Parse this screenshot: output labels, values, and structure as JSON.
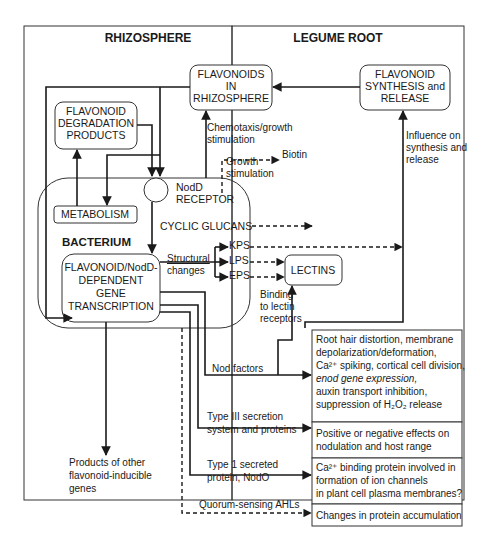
{
  "regions": {
    "rhizosphere": "RHIZOSPHERE",
    "legume_root": "LEGUME ROOT"
  },
  "nodes": {
    "flavonoids_rhizo": [
      "FLAVONOIDS",
      "IN",
      "RHIZOSPHERE"
    ],
    "flavonoid_synthesis": [
      "FLAVONOID",
      "SYNTHESIS and",
      "RELEASE"
    ],
    "degradation": [
      "FLAVONOID",
      "DEGRADATION",
      "PRODUCTS"
    ],
    "metabolism": "METABOLISM",
    "bacterium": "BACTERIUM",
    "nodd_receptor": [
      "NodD",
      "RECEPTOR"
    ],
    "cyclic_glucans": "CYCLIC GLUCANS",
    "transcription": [
      "FLAVONOID/NodD-",
      "DEPENDENT",
      "GENE",
      "TRANSCRIPTION"
    ],
    "kps": "KPS",
    "lps": "LPS",
    "eps": "EPS",
    "lectins": "LECTINS"
  },
  "labels": {
    "chemotaxis": [
      "Chemotaxis/growth",
      "stimulation"
    ],
    "biotin": "Biotin",
    "growth_stim": [
      "Growth",
      "stimulation"
    ],
    "influence": [
      "Influence on",
      "synthesis and",
      "release"
    ],
    "structural": [
      "Structural",
      "changes"
    ],
    "binding": [
      "Binding",
      "to lectin",
      "receptors"
    ],
    "nod_factors": "Nod factors",
    "type3": [
      "Type III secretion",
      "system and proteins"
    ],
    "type1": [
      "Type 1 secreted",
      "protein, NodO"
    ],
    "quorum": "Quorum-sensing AHLs",
    "other_products": [
      "Products of other",
      "flavonoid-inducible",
      "genes"
    ]
  },
  "effects": [
    [
      "Root hair distortion, membrane",
      "depolarization/deformation,",
      "Ca²⁺ spiking, cortical cell division,",
      "enod gene expression,",
      "auxin transport  inhibition,",
      "suppression of H₂O₂ release"
    ],
    [
      "Positive or negative effects on",
      "nodulation and host range"
    ],
    [
      "Ca²⁺ binding protein involved in",
      "formation of ion channels",
      "in plant cell plasma membranes?"
    ],
    [
      "Changes in protein accumulation"
    ]
  ]
}
